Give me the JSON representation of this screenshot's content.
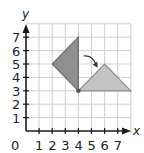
{
  "figure": {
    "x_axis_label": "x",
    "y_axis_label": "y",
    "origin_label": "0",
    "x_tick_labels": [
      "1",
      "2",
      "3",
      "4",
      "5",
      "6",
      "7"
    ],
    "y_tick_labels": [
      "1",
      "2",
      "3",
      "4",
      "5",
      "6",
      "7"
    ],
    "grid": {
      "x_min": 0,
      "x_max": 8,
      "y_min": 0,
      "y_max": 8
    },
    "shapes": [
      {
        "name": "original-triangle",
        "vertices": [
          [
            4,
            7
          ],
          [
            2,
            5
          ],
          [
            4,
            3
          ]
        ],
        "fill": "#8f8f8f",
        "stroke": "#6a6a6a"
      },
      {
        "name": "rotated-triangle",
        "vertices": [
          [
            4,
            3
          ],
          [
            6,
            5
          ],
          [
            8,
            3
          ]
        ],
        "fill": "#c4c4c4",
        "stroke": "#8a8a8a"
      }
    ],
    "center_of_rotation": [
      4,
      3
    ],
    "rotation_arrow": {
      "from": [
        4.4,
        5.6
      ],
      "to": [
        5.4,
        4.8
      ],
      "direction": "clockwise"
    },
    "colors": {
      "grid": "#cfcfcf",
      "axis": "#1a1a1a",
      "dark_shape": "#8f8f8f",
      "light_shape": "#c4c4c4"
    }
  }
}
